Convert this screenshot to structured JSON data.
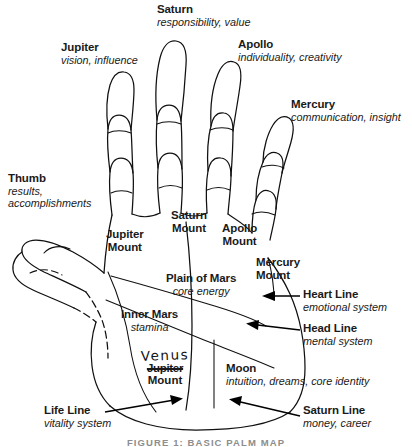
{
  "figure": {
    "caption": "FIGURE 1: BASIC PALM MAP",
    "background": "#ffffff",
    "ink": "#101010"
  },
  "fingers": [
    {
      "name": "thumb-label",
      "title": "Thumb",
      "subtitle": "results,",
      "subtitle2": "accomplishments"
    },
    {
      "name": "jupiter-label",
      "title": "Jupiter",
      "subtitle": "vision, influence"
    },
    {
      "name": "saturn-label",
      "title": "Saturn",
      "subtitle": "responsibility, value"
    },
    {
      "name": "apollo-label",
      "title": "Apollo",
      "subtitle": "individuality, creativity"
    },
    {
      "name": "mercury-label",
      "title": "Mercury",
      "subtitle": "communication, insight"
    }
  ],
  "mounts": [
    {
      "name": "jupiter-mount",
      "line1": "Jupiter",
      "line2": "Mount"
    },
    {
      "name": "saturn-mount",
      "line1": "Saturn",
      "line2": "Mount"
    },
    {
      "name": "apollo-mount",
      "line1": "Apollo",
      "line2": "Mount"
    },
    {
      "name": "mercury-mount",
      "line1": "Mercury",
      "line2": "Mount"
    }
  ],
  "regions": [
    {
      "name": "plain-of-mars",
      "title": "Plain of Mars",
      "subtitle": "core energy"
    },
    {
      "name": "inner-mars",
      "title": "Inner Mars",
      "subtitle": "stamina"
    },
    {
      "name": "moon-mount",
      "title": "Moon",
      "subtitle": "intuition, dreams, core identity"
    }
  ],
  "venus_annotation": {
    "handwritten": "Venus",
    "struck_through": "Jupiter",
    "trailing": "Mount"
  },
  "lines": [
    {
      "name": "heart-line",
      "title": "Heart Line",
      "subtitle": "emotional system"
    },
    {
      "name": "head-line",
      "title": "Head Line",
      "subtitle": "mental system"
    },
    {
      "name": "life-line",
      "title": "Life Line",
      "subtitle": "vitality system"
    },
    {
      "name": "saturn-line",
      "title": "Saturn Line",
      "subtitle": "money, career"
    }
  ]
}
